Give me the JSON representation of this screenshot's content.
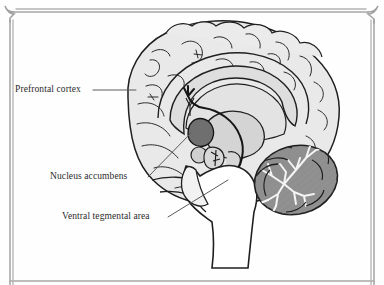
{
  "figure": {
    "type": "anatomical-diagram",
    "background_color": "#fefefe",
    "border_color": "#a8a8a8",
    "ink_color": "#222222",
    "label_color": "#2b2b2b"
  },
  "labels": {
    "prefrontal_cortex": "Prefrontal cortex",
    "nucleus_accumbens": "Nucleus accumbens",
    "ventral_tegmental_area": "Ventral tegmental area"
  },
  "structures": {
    "cortex_fill": "#e8e8e8",
    "corpus_callosum_fill": "#dcdcdc",
    "thalamus_fill": "#d2d2d2",
    "accumbens_fill": "#777777",
    "vta_fill": "#8c8c8c",
    "cerebellum_fill": "#8f8f8f",
    "brainstem_fill": "#ffffff"
  },
  "icons": {
    "corner_ornament": "curl-corner-icon",
    "leader_line": "leader-line-icon",
    "vta_marker": "circle-marker-icon"
  }
}
